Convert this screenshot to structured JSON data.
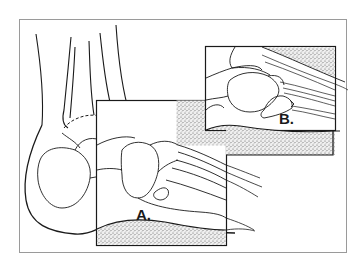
{
  "figure": {
    "style": "black line drawing with stippled shaded regions",
    "colors": {
      "background": "#ffffff",
      "frame": "#9a9a9a",
      "line": "#1a1a1a",
      "stipple": "#c8c8c8"
    },
    "insets": [
      {
        "id": "A",
        "label": "A."
      },
      {
        "id": "B",
        "label": "B."
      }
    ]
  }
}
